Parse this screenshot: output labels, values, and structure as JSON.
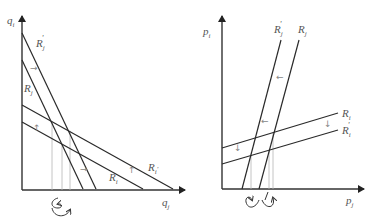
{
  "left_panel": {
    "y_axis_label": {
      "base": "q",
      "sub": "i"
    },
    "x_axis_label": {
      "base": "q",
      "sub": "j"
    },
    "curves": [
      {
        "name": "R_j'",
        "base": "R",
        "sub": "j",
        "prime": "'",
        "x1": 22,
        "y1": 33,
        "x2": 96,
        "y2": 189
      },
      {
        "name": "R_j",
        "base": "R",
        "sub": "j",
        "prime": "",
        "x1": 22,
        "y1": 60,
        "x2": 83,
        "y2": 189
      },
      {
        "name": "R_i'",
        "base": "R",
        "sub": "i",
        "prime": "'",
        "x1": 22,
        "y1": 105,
        "x2": 173,
        "y2": 189
      },
      {
        "name": "R_i",
        "base": "R",
        "sub": "i",
        "prime": "",
        "x1": 22,
        "y1": 122,
        "x2": 143,
        "y2": 189
      }
    ],
    "shift_arrows": [
      {
        "glyph": "→",
        "x": 30,
        "y": 71
      },
      {
        "glyph": "↑",
        "x": 33,
        "y": 131
      },
      {
        "glyph": "→",
        "x": 80,
        "y": 172
      },
      {
        "glyph": "↑",
        "x": 128,
        "y": 173
      }
    ],
    "dotted_x": [
      52,
      62,
      70
    ]
  },
  "right_panel": {
    "y_axis_label": {
      "base": "p",
      "sub": "i"
    },
    "x_axis_label": {
      "base": "p",
      "sub": "j"
    },
    "curves": [
      {
        "name": "R_j'",
        "base": "R",
        "sub": "j",
        "prime": "'",
        "x1": 242,
        "y1": 189,
        "x2": 281,
        "y2": 40
      },
      {
        "name": "R_j",
        "base": "R",
        "sub": "j",
        "prime": "",
        "x1": 259,
        "y1": 189,
        "x2": 299,
        "y2": 40
      },
      {
        "name": "R_i",
        "base": "R",
        "sub": "i",
        "prime": "",
        "x1": 222,
        "y1": 148,
        "x2": 338,
        "y2": 113
      },
      {
        "name": "R_i'",
        "base": "R",
        "sub": "i",
        "prime": "'",
        "x1": 222,
        "y1": 164,
        "x2": 338,
        "y2": 130
      }
    ],
    "shift_arrows": [
      {
        "glyph": "←",
        "x": 276,
        "y": 80
      },
      {
        "glyph": "←",
        "x": 261,
        "y": 124
      },
      {
        "glyph": "↓",
        "x": 234,
        "y": 151
      },
      {
        "glyph": "↓",
        "x": 324,
        "y": 127
      }
    ],
    "dotted_x": [
      251,
      269,
      273
    ]
  }
}
